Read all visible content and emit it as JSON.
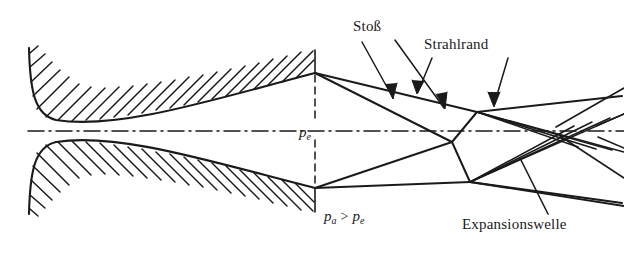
{
  "figure": {
    "type": "technical-line-diagram",
    "style": "scanned monochrome engineering drawing",
    "ink_color": "#1a1a1a",
    "background_color": "#ffffff",
    "width": 624,
    "height": 261
  },
  "labels": {
    "shock": "Stoß",
    "jet_boundary": "Strahlrand",
    "expansion_wave": "Expansionswelle",
    "exit_pressure": "p",
    "exit_pressure_sub": "e",
    "ambient_pressure": "p",
    "ambient_pressure_sub": "a",
    "pressure_relation_operator": ">",
    "pressure_relation_rhs": "p",
    "pressure_relation_rhs_sub": "e"
  },
  "geometry": {
    "centerline_y": 131,
    "nozzle_exit_x": 315,
    "nozzle_exit_upper_y": 73,
    "nozzle_exit_lower_y": 188,
    "nozzle_inlet_x": 28,
    "throat_x": 48,
    "upper_wall": "M28,48 C30,95 36,116 56,120 C120,128 210,100 315,73",
    "upper_wall_outer": "M28,48 C24,100 34,128 58,133 C130,143 215,108 316,80",
    "lower_wall": "M28,214 C30,167 36,146 56,142 C120,134 210,162 315,188",
    "lower_wall_outer": "M28,214 C24,162 34,134 58,129 C130,119 215,154 316,181",
    "shock_diamond_left_vertex": [
      452,
      142
    ],
    "shock_diamond_top_vertex": [
      477,
      112
    ],
    "shock_diamond_bottom_vertex": [
      470,
      182
    ],
    "expansion_crossing_x_range": [
      540,
      605
    ]
  },
  "annotations": {
    "stoss_leader_1": "M362,42 L392,96",
    "stoss_leader_2": "M392,40 L440,102",
    "strahlrand_leader_1": "M433,58 L419,90",
    "strahlrand_leader_2": "M507,58 L493,104",
    "expansionswelle_leader": "M546,214 L522,160"
  }
}
